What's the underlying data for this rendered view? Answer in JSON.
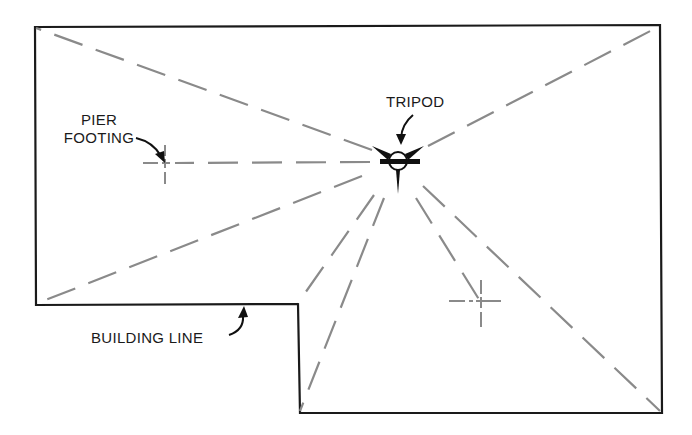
{
  "diagram": {
    "type": "site-layout",
    "labels": {
      "tripod": "TRIPOD",
      "pier_footing_line1": "PIER",
      "pier_footing_line2": "FOOTING",
      "building_line": "BUILDING LINE"
    },
    "colors": {
      "outline": "#1a1a1a",
      "sight_line": "#8a8a8a",
      "background": "#ffffff"
    },
    "building_outline": [
      [
        35,
        27
      ],
      [
        660,
        25
      ],
      [
        662,
        413
      ],
      [
        300,
        413
      ],
      [
        298,
        304
      ],
      [
        36,
        305
      ]
    ],
    "tripod": {
      "x": 398,
      "y": 161
    },
    "pier_footings": [
      {
        "name": "left",
        "x": 165,
        "y": 163
      },
      {
        "name": "right",
        "x": 480,
        "y": 301
      }
    ],
    "sight_lines": [
      {
        "to": "top-left-corner",
        "x": 36,
        "y": 28
      },
      {
        "to": "top-right-corner",
        "x": 658,
        "y": 27
      },
      {
        "to": "left-pier-footing",
        "x": 165,
        "y": 163
      },
      {
        "to": "bottom-left-corner",
        "x": 38,
        "y": 303
      },
      {
        "to": "notch-corner",
        "x": 298,
        "y": 303
      },
      {
        "to": "notch-bottom-corner",
        "x": 300,
        "y": 411
      },
      {
        "to": "right-pier-footing",
        "x": 480,
        "y": 301
      },
      {
        "to": "bottom-right-corner",
        "x": 660,
        "y": 411
      }
    ]
  }
}
